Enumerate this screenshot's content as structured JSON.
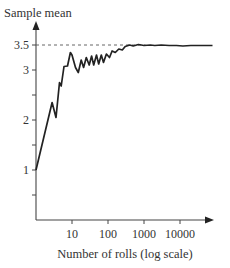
{
  "chart_data": {
    "type": "line",
    "title": "",
    "ylabel": "Sample mean",
    "xlabel": "Number of rolls (log scale)",
    "xscale": "log",
    "xlim": [
      1,
      100000
    ],
    "ylim": [
      0,
      3.7
    ],
    "grid": false,
    "legend": null,
    "x_ticks": [
      {
        "value": 10,
        "label": "10"
      },
      {
        "value": 100,
        "label": "100"
      },
      {
        "value": 1000,
        "label": "1000"
      },
      {
        "value": 10000,
        "label": "10000"
      }
    ],
    "y_ticks": [
      {
        "value": 0.5,
        "label": ""
      },
      {
        "value": 1,
        "label": "1"
      },
      {
        "value": 1.5,
        "label": ""
      },
      {
        "value": 2,
        "label": "2"
      },
      {
        "value": 2.5,
        "label": ""
      },
      {
        "value": 3,
        "label": "3"
      },
      {
        "value": 3.5,
        "label": "3.5"
      }
    ],
    "reference_line": {
      "y": 3.5,
      "style": "dashed",
      "x_end": 1100,
      "label": "3.5"
    },
    "series": [
      {
        "name": "Sample mean",
        "x": [
          1,
          2.8,
          3.6,
          4.5,
          5,
          6,
          7.5,
          9,
          10,
          12.5,
          15,
          18,
          21,
          25,
          30,
          35,
          40,
          48,
          55,
          65,
          75,
          90,
          110,
          130,
          160,
          200,
          250,
          300,
          400,
          500,
          700,
          1000,
          1500,
          2000,
          3000,
          5000,
          8000,
          12000,
          20000,
          40000,
          80000
        ],
        "values": [
          1.0,
          2.35,
          2.05,
          2.75,
          2.68,
          3.07,
          3.08,
          3.35,
          3.3,
          3.05,
          2.95,
          3.2,
          3.05,
          3.25,
          3.1,
          3.28,
          3.1,
          3.3,
          3.12,
          3.3,
          3.15,
          3.32,
          3.25,
          3.38,
          3.35,
          3.42,
          3.4,
          3.47,
          3.5,
          3.48,
          3.51,
          3.49,
          3.5,
          3.49,
          3.5,
          3.49,
          3.49,
          3.48,
          3.49,
          3.49,
          3.49
        ]
      }
    ]
  },
  "labels": {
    "ylabel": "Sample mean",
    "xlabel": "Number of rolls (log scale)",
    "y_tick_1": "1",
    "y_tick_2": "2",
    "y_tick_3": "3",
    "y_tick_35": "3.5",
    "x_tick_10": "10",
    "x_tick_100": "100",
    "x_tick_1000": "1000",
    "x_tick_10000": "10000"
  }
}
